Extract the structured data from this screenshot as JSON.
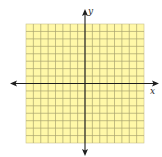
{
  "figure": {
    "type": "coordinate-plane",
    "grid": {
      "columns": 16,
      "rows": 16,
      "fill_color": "#FFF8A8",
      "line_color": "#A9A36F",
      "border_color": "#C8C08A"
    },
    "axes": {
      "color": "#1E1E1E",
      "x_label": "x",
      "y_label": "y",
      "arrows": [
        "left",
        "right",
        "up",
        "down"
      ]
    }
  }
}
